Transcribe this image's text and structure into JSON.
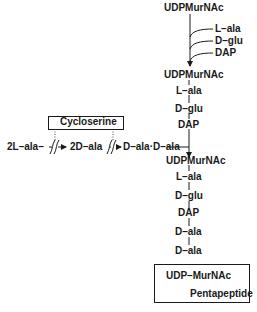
{
  "top": {
    "start": "UDPMurNAc",
    "additions": [
      "L–ala",
      "D–glu",
      "DAP"
    ]
  },
  "middle": {
    "compound": "UDPMurNAc",
    "chain": [
      "L–ala",
      "D–glu",
      "DAP"
    ]
  },
  "left_pathway": {
    "inhibitor": "Cycloserine",
    "substrate": "2L–ala–",
    "intermediate": "2D–ala",
    "product": "D–ala·D–ala"
  },
  "bottom": {
    "compound": "UDPMurNAc",
    "chain": [
      "L–ala",
      "D–glu",
      "DAP",
      "D–ala",
      "D–ala"
    ]
  },
  "result_box": {
    "line1": "UDP–MurNAc",
    "line2": "Pentapeptide"
  },
  "colors": {
    "ink": "#1a1a1a",
    "background": "#ffffff"
  }
}
